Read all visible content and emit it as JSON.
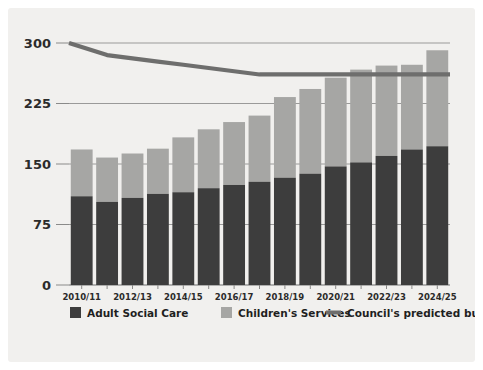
{
  "chart_data": {
    "type": "bar",
    "subtype": "stacked-bar-with-line",
    "title": "",
    "xlabel": "",
    "ylabel": "",
    "ylim": [
      0,
      300
    ],
    "yticks": [
      0,
      75,
      150,
      225,
      300
    ],
    "ytick_labels": [
      "0",
      "75",
      "150",
      "225",
      "300"
    ],
    "grid": true,
    "grid_axis": "y",
    "legend_position": "bottom",
    "categories": [
      "2010/11",
      "2011/12",
      "2012/13",
      "2013/14",
      "2014/15",
      "2015/16",
      "2016/17",
      "2017/18",
      "2018/19",
      "2019/20",
      "2020/21",
      "2021/22",
      "2022/23",
      "2023/24",
      "2024/25"
    ],
    "xtick_labels_shown": [
      "2010/11",
      "2012/13",
      "2014/15",
      "2016/17",
      "2018/19",
      "2020/21",
      "2022/23",
      "2024/25"
    ],
    "series": [
      {
        "name": "Adult Social Care",
        "color": "#3d3d3d",
        "type": "bar",
        "values": [
          110,
          103,
          108,
          113,
          115,
          120,
          124,
          128,
          133,
          138,
          147,
          152,
          160,
          168,
          172
        ]
      },
      {
        "name": "Children's Services",
        "color": "#a6a6a4",
        "type": "bar",
        "values": [
          58,
          55,
          55,
          56,
          68,
          73,
          78,
          82,
          100,
          105,
          110,
          115,
          112,
          105,
          119
        ]
      },
      {
        "name": "Council's predicted budget",
        "color": "#6e6e6d",
        "type": "line",
        "values": [
          300,
          285,
          281,
          277,
          273,
          269,
          265,
          261,
          261,
          261,
          261,
          261,
          261,
          261,
          261
        ]
      }
    ],
    "totals": [
      168,
      158,
      163,
      169,
      183,
      193,
      202,
      210,
      233,
      243,
      257,
      267,
      272,
      273,
      291
    ]
  },
  "legend": {
    "items": [
      {
        "label": "Adult Social Care",
        "marker": "square",
        "color": "#3d3d3d"
      },
      {
        "label": "Children's Services",
        "marker": "square",
        "color": "#a6a6a4"
      },
      {
        "label": "Council's predicted budget",
        "marker": "line",
        "color": "#6e6e6d"
      }
    ]
  },
  "colors": {
    "panel_background": "#f1f0ee",
    "page_background": "#ffffff",
    "adult_social_care": "#3d3d3d",
    "childrens_services": "#a6a6a4",
    "budget_line": "#6e6e6d",
    "gridline": "#9a9a99",
    "text": "#2b2b2b"
  }
}
